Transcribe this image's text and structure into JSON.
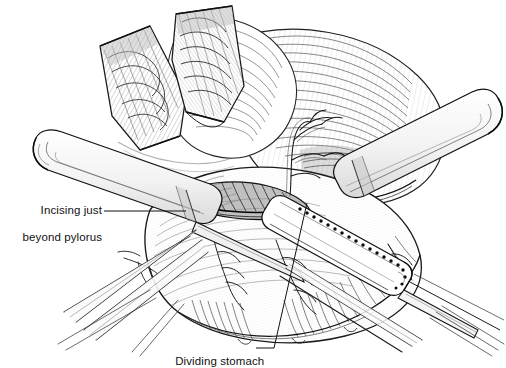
{
  "figure": {
    "style": "pen-and-ink medical line drawing, black on white",
    "background_color": "#ffffff",
    "ink_color": "#1a1a1a",
    "width": 506,
    "height": 368
  },
  "annotations": [
    {
      "id": "incising-just-beyond-pylorus",
      "line1": "Incising just",
      "line2": "beyond pylorus",
      "full_text": "Incising just beyond pylorus",
      "align": "right",
      "leader_from": [
        104,
        211
      ],
      "leader_to": [
        186,
        211
      ]
    },
    {
      "id": "dividing-stomach",
      "line1": "Dividing stomach",
      "line2": "",
      "full_text": "Dividing stomach",
      "align": "left",
      "leader_from": [
        256,
        348
      ],
      "leader_to": [
        307,
        203
      ]
    }
  ],
  "anatomy": {
    "items": [
      {
        "name": "retractor-blade-left",
        "kind": "instrument",
        "label": "Richardson retractor blade"
      },
      {
        "name": "retractor-blade-right",
        "kind": "instrument",
        "label": "Richardson retractor blade"
      },
      {
        "name": "stomach-body",
        "kind": "organ",
        "label": "Stomach"
      },
      {
        "name": "duodenum-pylorus",
        "kind": "organ",
        "label": "Pylorus / proximal duodenum"
      },
      {
        "name": "vascular-arcade",
        "kind": "vessel",
        "label": "Gastric vascular arcade"
      },
      {
        "name": "greater-curvature-vessels",
        "kind": "vessel",
        "label": "Gastroepiploic vessels"
      },
      {
        "name": "linear-stapler-right",
        "kind": "instrument",
        "label": "Linear stapler"
      },
      {
        "name": "linear-stapler-left",
        "kind": "instrument",
        "label": "Linear cutting stapler"
      },
      {
        "name": "staple-line",
        "kind": "marking",
        "label": "Staple line"
      }
    ],
    "staple_dot_count": 19
  },
  "colors": {
    "ink": "#1a1a1a",
    "ink_light": "#6f6f6f",
    "ink_faint": "#a8a8a8",
    "paper": "#ffffff",
    "shade": "#d8d8d8"
  }
}
